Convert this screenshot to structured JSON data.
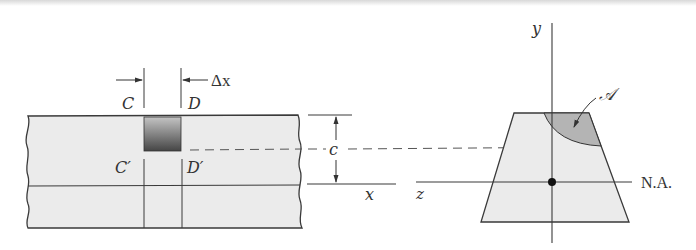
{
  "figure": {
    "type": "beam-shear-flow-diagram",
    "left_view": {
      "description": "Side view of beam segment with element between sections C and D",
      "labels": {
        "section_c": "C",
        "section_d": "D",
        "section_c_prime": "C′",
        "section_d_prime": "D′",
        "delta_x": "Δx",
        "distance_c": "c",
        "x_axis": "x"
      }
    },
    "right_view": {
      "description": "Trapezoidal cross section with shaded area above dashed line",
      "labels": {
        "y_axis": "y",
        "z_axis": "z",
        "area": "𝒜",
        "neutral_axis": "N.A."
      }
    },
    "colors": {
      "beam_fill": "#ebebeb",
      "element_dark": "#4a4a4a",
      "element_light": "#b8b8b8",
      "area_fill": "#b4b4b4",
      "line": "#3a3a3a",
      "dashed": "#555555"
    }
  }
}
